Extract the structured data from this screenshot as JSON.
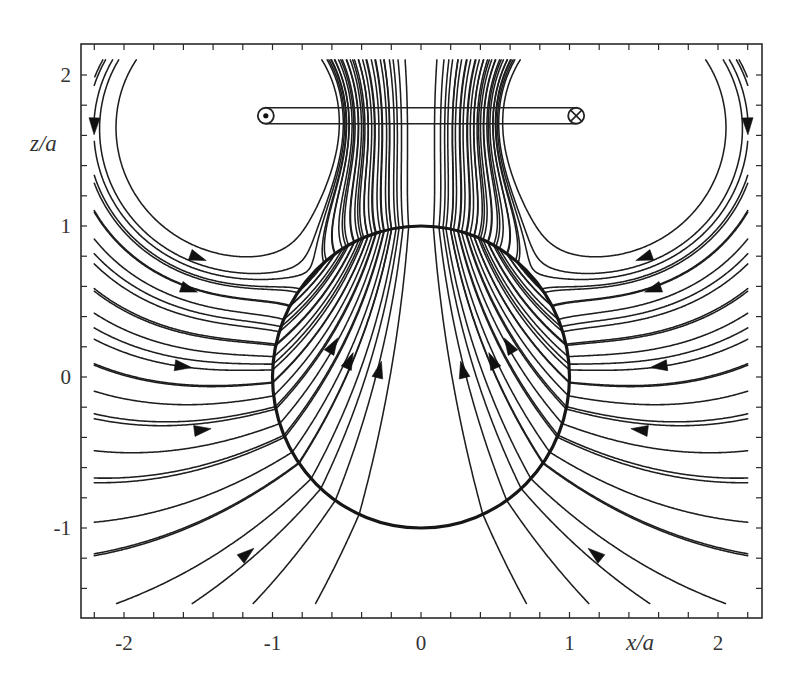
{
  "figure": {
    "frame": {
      "left": 81,
      "top": 44,
      "right": 762,
      "bottom": 618
    },
    "transform": {
      "origin_px": [
        421,
        377
      ],
      "scale_x": 148.5,
      "scale_z": 151
    },
    "x_axis": {
      "label": "x/a",
      "label_pos": [
        640,
        650
      ],
      "ticks": {
        "from": -2.2,
        "to": 2.2,
        "step": 0.2
      },
      "tick_labels": [
        {
          "value": -2,
          "text": "-2"
        },
        {
          "value": -1,
          "text": "-1"
        },
        {
          "value": 0,
          "text": "0"
        },
        {
          "value": 1,
          "text": "1"
        },
        {
          "value": 2,
          "text": "2"
        }
      ]
    },
    "z_axis": {
      "label": "z/a",
      "label_pos": [
        30,
        151
      ],
      "ticks": {
        "from": -1.4,
        "to": 2.0,
        "step": 0.2
      },
      "tick_labels": [
        {
          "value": 2,
          "text": "2"
        },
        {
          "value": 1,
          "text": "1"
        },
        {
          "value": 0,
          "text": "0"
        },
        {
          "value": -1,
          "text": "-1"
        }
      ]
    },
    "sphere": {
      "center": [
        0,
        0
      ],
      "radius": 1
    },
    "current_loop": {
      "height": 1.73,
      "radius": 1.0,
      "tube_half_height": 0.053,
      "left_end": {
        "symbol": "current-out-of-page",
        "x": -1.0
      },
      "right_end": {
        "symbol": "current-into-page",
        "x": 1.0
      }
    }
  },
  "diagram": {
    "type": "field-lines",
    "model": {
      "wires": [
        {
          "x": -1.05,
          "z": 1.73,
          "current": 1
        },
        {
          "x": 1.05,
          "z": 1.73,
          "current": -1
        }
      ],
      "sphere_image_coefficient": 0.86,
      "clip": {
        "xmin": -2.2,
        "xmax": 2.2,
        "zmin": -1.5,
        "zmax": 2.1
      }
    },
    "seed_points_left": [
      [
        -2.2,
        1.98
      ],
      [
        -2.16,
        1.73
      ],
      [
        -2.05,
        1.73
      ],
      [
        -2.18,
        1.28
      ],
      [
        -2.18,
        1.07
      ],
      [
        -2.18,
        0.89
      ],
      [
        -2.18,
        0.73
      ],
      [
        -2.18,
        0.57
      ],
      [
        -2.18,
        0.41
      ],
      [
        -2.18,
        0.24
      ],
      [
        -2.18,
        0.08
      ],
      [
        -2.18,
        -0.1
      ],
      [
        -2.18,
        -0.28
      ],
      [
        -2.18,
        -0.49
      ],
      [
        -2.18,
        -0.7
      ],
      [
        -2.18,
        -0.96
      ],
      [
        -2.18,
        -1.18
      ],
      [
        -2.05,
        -1.5
      ],
      [
        -1.54,
        -1.5
      ],
      [
        -1.13,
        -1.5
      ],
      [
        -0.71,
        -1.5
      ]
    ],
    "extra_funnel_seeds_left": [
      [
        -0.62,
        2.1
      ],
      [
        -0.58,
        2.1
      ],
      [
        -0.54,
        2.1
      ],
      [
        -0.5,
        2.1
      ],
      [
        -0.46,
        2.1
      ],
      [
        -0.42,
        2.1
      ],
      [
        -0.37,
        2.1
      ],
      [
        -0.31,
        2.1
      ],
      [
        -0.25,
        2.1
      ]
    ],
    "arrows_left": [
      [
        -2.2,
        1.66
      ],
      [
        -1.5,
        0.79
      ],
      [
        -1.56,
        0.58
      ],
      [
        -1.6,
        0.07
      ],
      [
        -1.47,
        -0.35
      ],
      [
        -1.17,
        -1.17
      ],
      [
        -0.59,
        0.21
      ],
      [
        -0.48,
        0.11
      ],
      [
        -0.28,
        0.05
      ]
    ],
    "mirror_symmetric": true
  }
}
